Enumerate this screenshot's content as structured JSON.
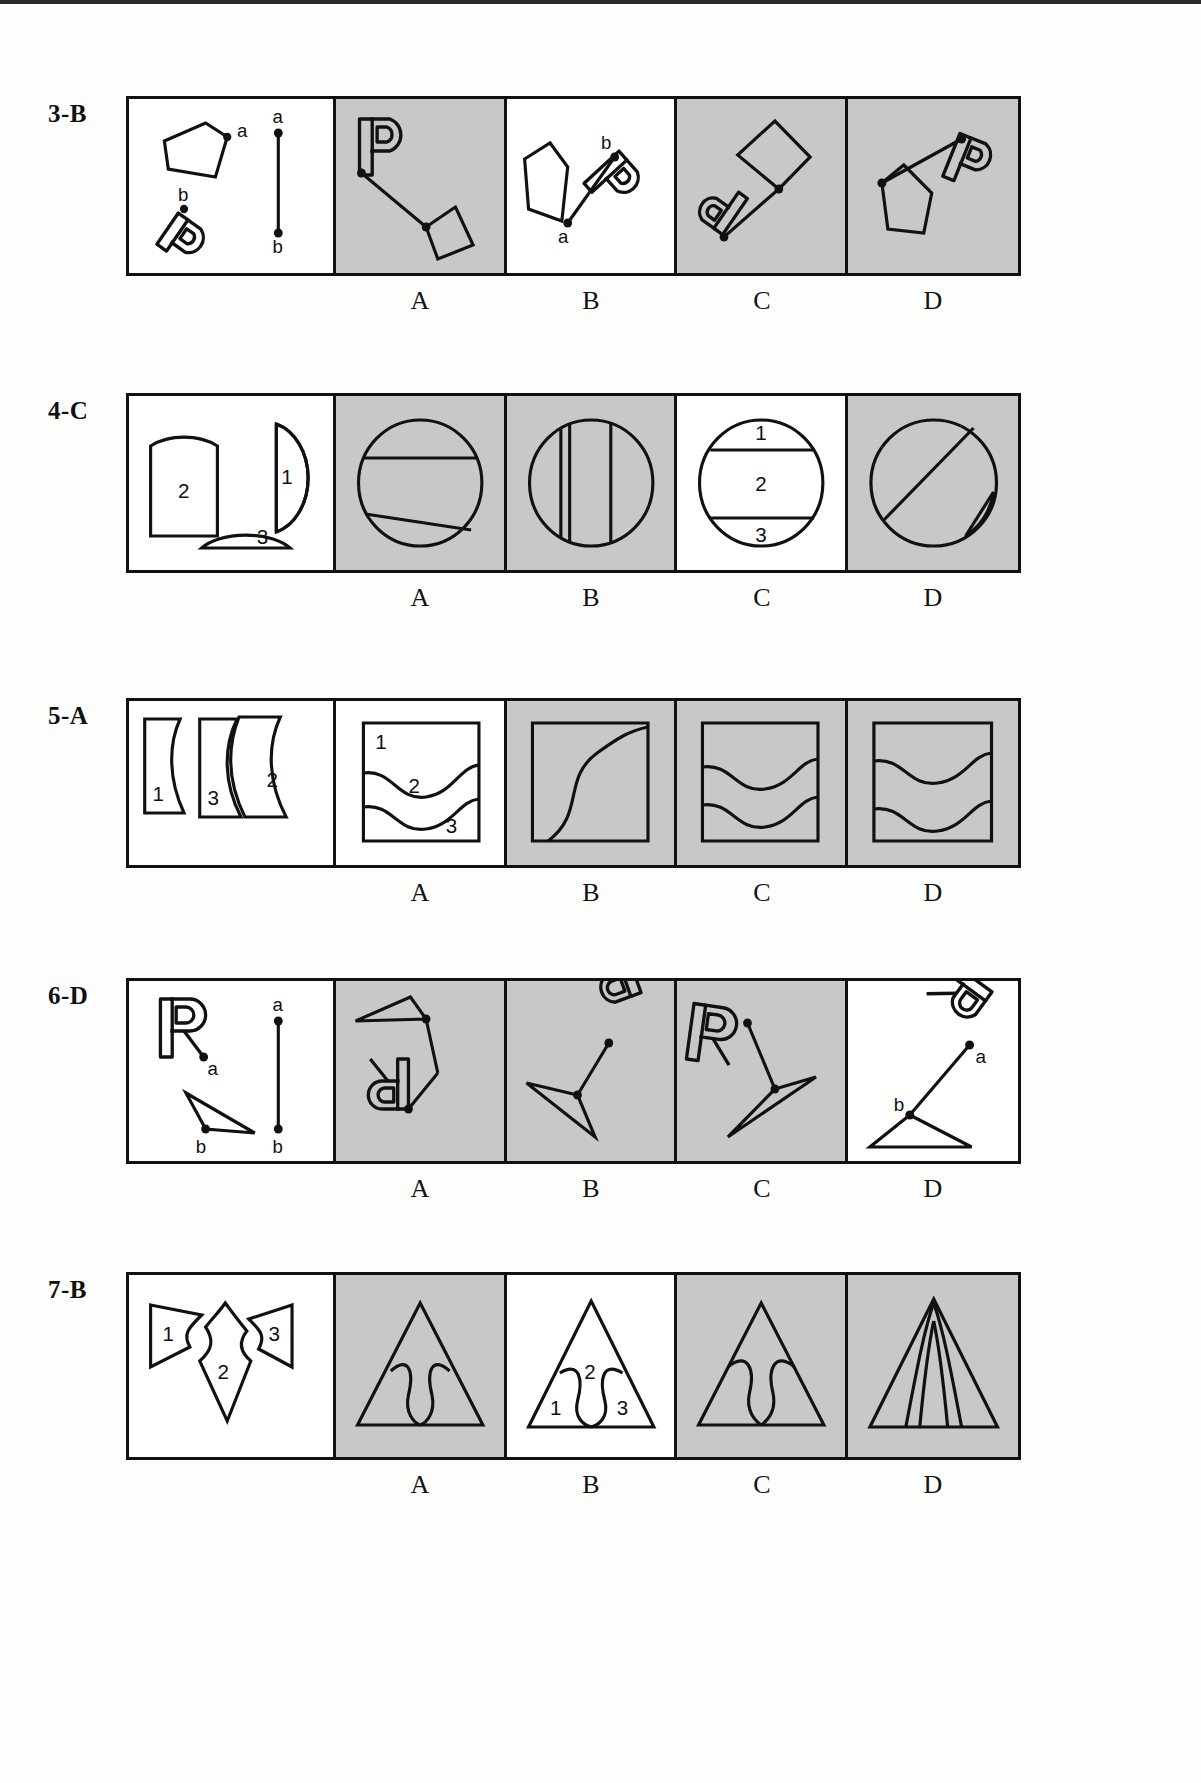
{
  "page": {
    "background_color": "#fdfdfc",
    "panel_gray": "#c8c8c8",
    "ink_color": "#111111",
    "top_rule": true
  },
  "choice_labels": [
    "A",
    "B",
    "C",
    "D"
  ],
  "rows": [
    {
      "id": "row-3",
      "label": "3-B",
      "item_number": "3",
      "answer": "B",
      "stem_description": "Quadrilateral with point a and letter P with point b, plus a vertical segment with endpoints a (top) and b (bottom)",
      "stem_point_labels": [
        "a",
        "b",
        "a",
        "b"
      ],
      "options": [
        {
          "letter": "A",
          "shaded": true,
          "point_labels": []
        },
        {
          "letter": "B",
          "shaded": false,
          "point_labels": [
            "b",
            "a"
          ]
        },
        {
          "letter": "C",
          "shaded": true,
          "point_labels": []
        },
        {
          "letter": "D",
          "shaded": true,
          "point_labels": []
        }
      ]
    },
    {
      "id": "row-4",
      "label": "4-C",
      "item_number": "4",
      "answer": "C",
      "stem_description": "Three circle fragments numbered 2 (large rounded rectangle), 1 (lens sliver) and 3 (shallow segment)",
      "stem_point_labels": [
        "2",
        "1",
        "3"
      ],
      "options": [
        {
          "letter": "A",
          "shaded": true,
          "point_labels": []
        },
        {
          "letter": "B",
          "shaded": true,
          "point_labels": []
        },
        {
          "letter": "C",
          "shaded": false,
          "point_labels": [
            "1",
            "2",
            "3"
          ]
        },
        {
          "letter": "D",
          "shaded": true,
          "point_labels": []
        }
      ]
    },
    {
      "id": "row-5",
      "label": "5-A",
      "item_number": "5",
      "answer": "A",
      "stem_description": "Three wavy-edged square fragments numbered 1, 3 and 2",
      "stem_point_labels": [
        "1",
        "3",
        "2"
      ],
      "options": [
        {
          "letter": "A",
          "shaded": false,
          "point_labels": [
            "1",
            "2",
            "3"
          ]
        },
        {
          "letter": "B",
          "shaded": true,
          "point_labels": []
        },
        {
          "letter": "C",
          "shaded": true,
          "point_labels": []
        },
        {
          "letter": "D",
          "shaded": true,
          "point_labels": []
        }
      ]
    },
    {
      "id": "row-6",
      "label": "6-D",
      "item_number": "6",
      "answer": "D",
      "stem_description": "Letter R with point a and a triangle with point b, plus a vertical segment with endpoints a (top) and b (bottom)",
      "stem_point_labels": [
        "a",
        "b",
        "a",
        "b"
      ],
      "options": [
        {
          "letter": "A",
          "shaded": true,
          "point_labels": []
        },
        {
          "letter": "B",
          "shaded": true,
          "point_labels": []
        },
        {
          "letter": "C",
          "shaded": true,
          "point_labels": []
        },
        {
          "letter": "D",
          "shaded": false,
          "point_labels": [
            "a",
            "b"
          ]
        }
      ]
    },
    {
      "id": "row-7",
      "label": "7-B",
      "item_number": "7",
      "answer": "B",
      "stem_description": "Three triangle fragments numbered 1, 2 and 3 that assemble into a triangle",
      "stem_point_labels": [
        "1",
        "2",
        "3"
      ],
      "options": [
        {
          "letter": "A",
          "shaded": true,
          "point_labels": []
        },
        {
          "letter": "B",
          "shaded": false,
          "point_labels": [
            "2",
            "1",
            "3"
          ]
        },
        {
          "letter": "C",
          "shaded": true,
          "point_labels": []
        },
        {
          "letter": "D",
          "shaded": true,
          "point_labels": []
        }
      ]
    }
  ]
}
